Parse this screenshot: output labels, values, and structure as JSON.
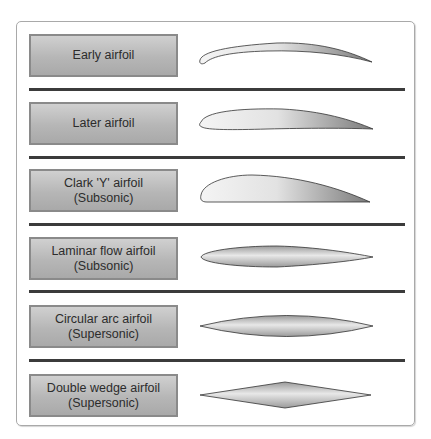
{
  "header": {
    "clipped_caption": "Figure 1-XX. Types of airfoil sections"
  },
  "rows": [
    {
      "line1": "Early airfoil",
      "line2": "",
      "shape": "early-airfoil"
    },
    {
      "line1": "Later airfoil",
      "line2": "",
      "shape": "later-airfoil"
    },
    {
      "line1": "Clark 'Y' airfoil",
      "line2": "(Subsonic)",
      "shape": "clark-y-airfoil"
    },
    {
      "line1": "Laminar flow airfoil",
      "line2": "(Subsonic)",
      "shape": "laminar-flow-airfoil"
    },
    {
      "line1": "Circular arc airfoil",
      "line2": "(Supersonic)",
      "shape": "circular-arc-airfoil"
    },
    {
      "line1": "Double wedge airfoil",
      "line2": "(Supersonic)",
      "shape": "double-wedge-airfoil"
    }
  ],
  "colors": {
    "label_fill": "#b6b6b6",
    "label_border": "#8a8a8a",
    "divider": "#3b3b3b",
    "frame": "#a9a9a9"
  }
}
